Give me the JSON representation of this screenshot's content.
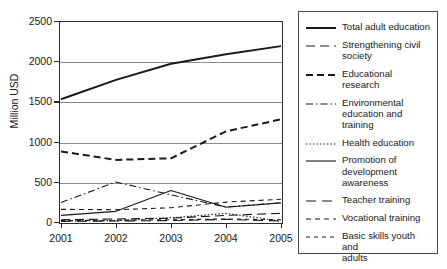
{
  "chart_data": {
    "type": "line",
    "title": "",
    "xlabel": "",
    "ylabel": "Million USD",
    "categories": [
      "2001",
      "2002",
      "2003",
      "2004",
      "2005"
    ],
    "x": [
      2001,
      2002,
      2003,
      2004,
      2005
    ],
    "ylim": [
      0,
      2500
    ],
    "ytick_labels": [
      "0",
      "500",
      "1000",
      "1500",
      "2000",
      "2500"
    ],
    "ytick_values": [
      0,
      500,
      1000,
      1500,
      2000,
      2500
    ],
    "grid": "horizontal",
    "legend_position": "right",
    "series": [
      {
        "name": "Total adult education",
        "style": "solid",
        "width": 2.0,
        "dash": "none",
        "values": [
          1540,
          1780,
          1980,
          2100,
          2200
        ]
      },
      {
        "name": "Strengthening civil society",
        "style": "long-dash",
        "width": 1.1,
        "dash": "9,5",
        "values": [
          40,
          50,
          60,
          95,
          120
        ]
      },
      {
        "name": "Educational research",
        "style": "dashed",
        "width": 2.0,
        "dash": "7,4",
        "values": [
          890,
          785,
          805,
          1140,
          1290
        ]
      },
      {
        "name": "Environmental education and training",
        "style": "dash-dot",
        "width": 1.1,
        "dash": "7,3,1.5,3",
        "values": [
          255,
          510,
          350,
          200,
          250
        ]
      },
      {
        "name": "Health education",
        "style": "dotted",
        "width": 1.1,
        "dash": "1.5,2",
        "values": [
          25,
          30,
          65,
          120,
          25
        ]
      },
      {
        "name": "Promotion of development awareness",
        "style": "solid-thin",
        "width": 1.1,
        "dash": "none",
        "values": [
          95,
          145,
          405,
          195,
          250
        ]
      },
      {
        "name": "Teacher training",
        "style": "long-dash-thin",
        "width": 1.1,
        "dash": "10,6",
        "values": [
          20,
          25,
          30,
          45,
          25
        ]
      },
      {
        "name": "Vocational training",
        "style": "short-dash-thin",
        "width": 1.1,
        "dash": "5,4",
        "values": [
          170,
          165,
          190,
          260,
          295
        ]
      },
      {
        "name": "Basic skills youth and adults",
        "style": "dash-thin",
        "width": 1.1,
        "dash": "4,4",
        "values": [
          30,
          35,
          40,
          50,
          40
        ]
      }
    ]
  },
  "legend": {
    "items": [
      {
        "label": "Total adult education"
      },
      {
        "label": "Strengthening civil\nsociety"
      },
      {
        "label": "Educational research"
      },
      {
        "label": "Environmental\neducation and training"
      },
      {
        "label": "Health education"
      },
      {
        "label": "Promotion of\ndevelopment awareness"
      },
      {
        "label": "Teacher training"
      },
      {
        "label": "Vocational training"
      },
      {
        "label": "Basic skills youth and\nadults"
      }
    ]
  },
  "colors": {
    "line": "#1a1a1a",
    "grid": "#8d8d8d",
    "axis": "#2b2b2b",
    "background": "#ffffff"
  }
}
